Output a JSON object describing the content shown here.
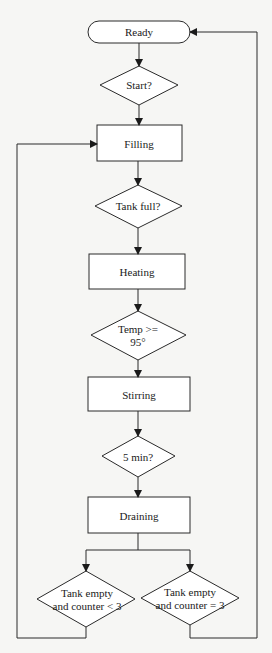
{
  "diagram": {
    "type": "flowchart",
    "colors": {
      "background": "#f6f6f4",
      "stroke": "#2a2a2a",
      "text": "#1a1a1a"
    },
    "nodes": [
      {
        "id": "ready",
        "shape": "terminator",
        "label": "Ready"
      },
      {
        "id": "start",
        "shape": "decision",
        "label": "Start?"
      },
      {
        "id": "filling",
        "shape": "process",
        "label": "Filling"
      },
      {
        "id": "tank_full",
        "shape": "decision",
        "label": "Tank full?"
      },
      {
        "id": "heating",
        "shape": "process",
        "label": "Heating"
      },
      {
        "id": "temp",
        "shape": "decision",
        "label_line1": "Temp >=",
        "label_line2": "95°"
      },
      {
        "id": "stirring",
        "shape": "process",
        "label": "Stirring"
      },
      {
        "id": "five_min",
        "shape": "decision",
        "label": "5 min?"
      },
      {
        "id": "draining",
        "shape": "process",
        "label": "Draining"
      },
      {
        "id": "empty_lt3",
        "shape": "decision",
        "label_line1": "Tank empty",
        "label_line2": "and counter < 3"
      },
      {
        "id": "empty_eq3",
        "shape": "decision",
        "label_line1": "Tank empty",
        "label_line2": "and counter = 3"
      }
    ],
    "edges": [
      {
        "from": "ready",
        "to": "start"
      },
      {
        "from": "start",
        "to": "filling"
      },
      {
        "from": "filling",
        "to": "tank_full"
      },
      {
        "from": "tank_full",
        "to": "heating"
      },
      {
        "from": "heating",
        "to": "temp"
      },
      {
        "from": "temp",
        "to": "stirring"
      },
      {
        "from": "stirring",
        "to": "five_min"
      },
      {
        "from": "five_min",
        "to": "draining"
      },
      {
        "from": "draining",
        "to": "empty_lt3"
      },
      {
        "from": "draining",
        "to": "empty_eq3"
      },
      {
        "from": "empty_lt3",
        "to": "filling",
        "note": "loop back (left)"
      },
      {
        "from": "empty_eq3",
        "to": "ready",
        "note": "loop back (right)"
      }
    ]
  }
}
